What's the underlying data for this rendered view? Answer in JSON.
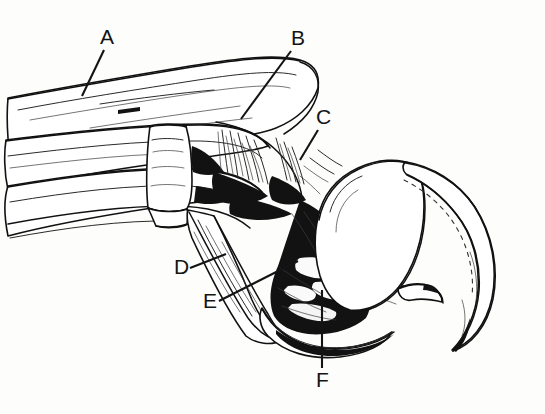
{
  "figure": {
    "style": "pen-and-ink stipple line drawing",
    "background_color": "#fdfdfc",
    "ink_color": "#121212",
    "width": 545,
    "height": 414
  },
  "labels": [
    {
      "id": "A",
      "text": "A",
      "x": 100,
      "y": 44,
      "leader": {
        "x1": 104,
        "y1": 50,
        "x2": 82,
        "y2": 96
      }
    },
    {
      "id": "B",
      "text": "B",
      "x": 291,
      "y": 45,
      "leader": {
        "x1": 291,
        "y1": 51,
        "x2": 241,
        "y2": 119
      }
    },
    {
      "id": "C",
      "text": "C",
      "x": 316,
      "y": 124,
      "leader": {
        "x1": 318,
        "y1": 130,
        "x2": 300,
        "y2": 160
      }
    },
    {
      "id": "D",
      "text": "D",
      "x": 174,
      "y": 274,
      "leader": {
        "x1": 190,
        "y1": 268,
        "x2": 226,
        "y2": 254
      }
    },
    {
      "id": "E",
      "text": "E",
      "x": 203,
      "y": 308,
      "leader": {
        "x1": 219,
        "y1": 301,
        "x2": 298,
        "y2": 261
      }
    },
    {
      "id": "F",
      "text": "F",
      "x": 316,
      "y": 387,
      "leader": {
        "x1": 322,
        "y1": 290,
        "x2": 322,
        "y2": 368
      }
    }
  ],
  "structures": [
    {
      "name": "upper-limb-shaft",
      "description": "long tapering bone and tendon bundle entering from upper left"
    },
    {
      "name": "tendon-strands",
      "description": "parallel tendon strands running lower left"
    },
    {
      "name": "metatarsal-block",
      "description": "short rectangular bone block at center left"
    },
    {
      "name": "fibrous-insertion",
      "description": "dark brush-stroke fibrous insertion region below joint"
    },
    {
      "name": "distal-phalanx",
      "description": "descending slender phalanx toward lower center"
    },
    {
      "name": "dark-textured-pad",
      "description": "heavily cross-hatched dark mass at lower center"
    },
    {
      "name": "claw-sheath",
      "description": "large smooth rounded claw sheath at right"
    },
    {
      "name": "claw-tip",
      "description": "curved pointed claw tip sweeping down to lower right"
    }
  ]
}
